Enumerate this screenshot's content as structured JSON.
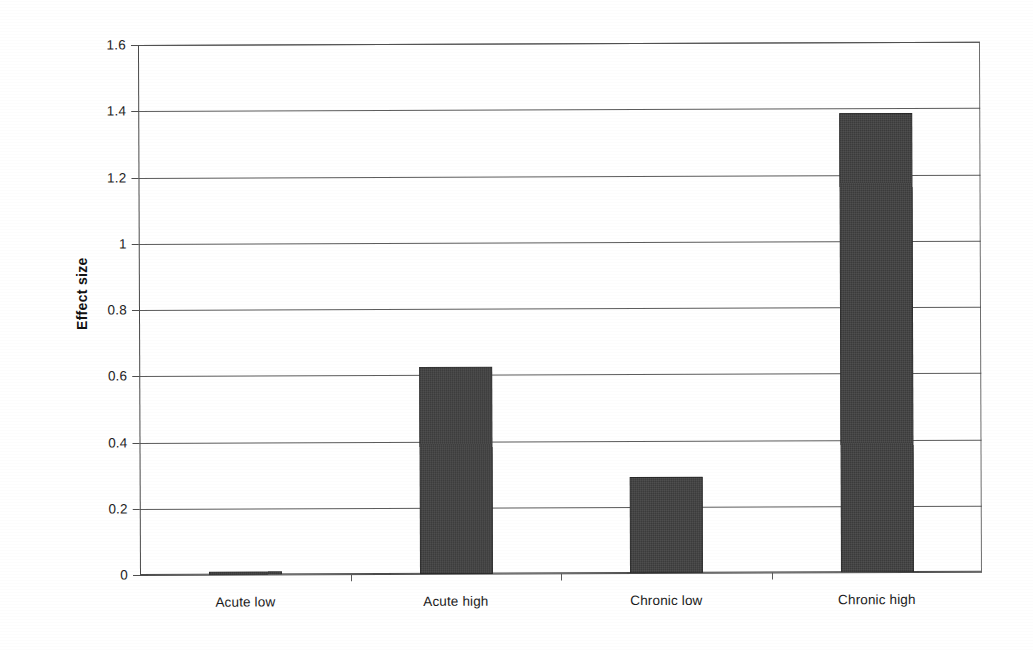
{
  "chart_data": {
    "type": "bar",
    "title": "",
    "subtitle": "",
    "xlabel": "",
    "ylabel": "Effect size",
    "categories": [
      "Acute low",
      "Acute high",
      "Chronic low",
      "Chronic high"
    ],
    "values": [
      0.01,
      0.625,
      0.29,
      1.385
    ],
    "series": [
      {
        "name": "Effect size",
        "values": [
          0.01,
          0.625,
          0.29,
          1.385
        ]
      }
    ],
    "ylim": [
      0,
      1.6
    ],
    "ytick_values": [
      0,
      0.2,
      0.4,
      0.6,
      0.8,
      1.0,
      1.2,
      1.4,
      1.6
    ],
    "ytick_labels": [
      "0",
      "0.2",
      "0.4",
      "0.6",
      "0.8",
      "1",
      "1.2",
      "1.4",
      "1.6"
    ],
    "grid": "horizontal",
    "legend": "none",
    "bar_color": "#3b3b3b",
    "background_color": "#ffffff",
    "axis_color": "#4e4e4e",
    "annotations": []
  }
}
